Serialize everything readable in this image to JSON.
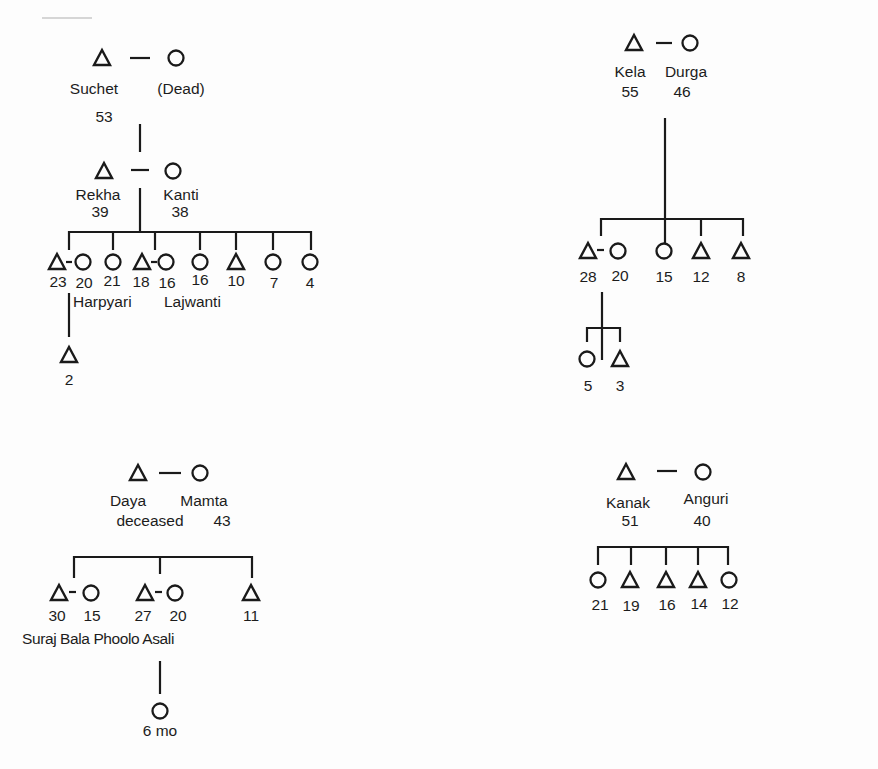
{
  "figure": {
    "type": "kinship-diagram",
    "legend": {
      "male": "triangle",
      "female": "circle",
      "marriage": "dash",
      "descent": "vertical-line"
    },
    "stroke_color": "#1a1a1a"
  },
  "families": [
    {
      "id": "suchet",
      "parents": [
        {
          "sex": "male",
          "name": "Suchet",
          "age": "53",
          "x": 102,
          "y": 58
        },
        {
          "sex": "female",
          "name": "(Dead)",
          "age": "",
          "x": 176,
          "y": 58
        }
      ],
      "texts": [
        {
          "text": "Suchet",
          "x": 94,
          "y": 80
        },
        {
          "text": "(Dead)",
          "x": 181,
          "y": 80
        },
        {
          "text": "53",
          "x": 104,
          "y": 108
        }
      ],
      "descent": [
        [
          140,
          124,
          140,
          152
        ]
      ],
      "lines": [
        [
          130,
          58,
          150,
          58
        ]
      ],
      "children_couple": {
        "parents": [
          {
            "sex": "male",
            "name": "Rekha",
            "age": "39",
            "x": 104,
            "y": 171
          },
          {
            "sex": "female",
            "name": "Kanti",
            "age": "38",
            "x": 173,
            "y": 171
          }
        ],
        "texts": [
          {
            "text": "Rekha",
            "x": 98,
            "y": 186
          },
          {
            "text": "39",
            "x": 100,
            "y": 203
          },
          {
            "text": "Kanti",
            "x": 181,
            "y": 186
          },
          {
            "text": "38",
            "x": 180,
            "y": 203
          }
        ]
      },
      "children": [
        {
          "sex": "male",
          "age": "23",
          "x": 57,
          "y": 262,
          "spouse": {
            "sex": "female",
            "age": "20",
            "name": "Harpyari",
            "x": 83,
            "y": 262
          }
        },
        {
          "sex": "female",
          "age": "21",
          "x": 113,
          "y": 262
        },
        {
          "sex": "male",
          "age": "18",
          "x": 142,
          "y": 262,
          "spouse": {
            "sex": "female",
            "age": "16",
            "name": "Lajwanti",
            "x": 166,
            "y": 262
          }
        },
        {
          "sex": "female",
          "age": "16",
          "x": 200,
          "y": 262
        },
        {
          "sex": "male",
          "age": "10",
          "x": 236,
          "y": 262
        },
        {
          "sex": "female",
          "age": "7",
          "x": 273,
          "y": 262
        },
        {
          "sex": "female",
          "age": "4",
          "x": 310,
          "y": 262
        }
      ],
      "grandchildren": [
        {
          "sex": "male",
          "age": "2",
          "x": 69,
          "y": 355
        }
      ]
    },
    {
      "id": "kela",
      "parents": [
        {
          "sex": "male",
          "name": "Kela",
          "age": "55",
          "x": 634,
          "y": 43
        },
        {
          "sex": "female",
          "name": "Durga",
          "age": "46",
          "x": 690,
          "y": 43
        }
      ],
      "children": [
        {
          "sex": "male",
          "age": "28",
          "x": 588,
          "y": 251,
          "spouse": {
            "sex": "female",
            "age": "20",
            "x": 618,
            "y": 251
          }
        },
        {
          "sex": "female",
          "age": "15",
          "x": 664,
          "y": 251
        },
        {
          "sex": "male",
          "age": "12",
          "x": 701,
          "y": 251
        },
        {
          "sex": "male",
          "age": "8",
          "x": 741,
          "y": 251
        }
      ],
      "grandchildren": [
        {
          "sex": "female",
          "age": "5",
          "x": 587,
          "y": 359
        },
        {
          "sex": "male",
          "age": "3",
          "x": 620,
          "y": 359
        }
      ]
    },
    {
      "id": "daya",
      "parents": [
        {
          "sex": "male",
          "name": "Daya",
          "age": "deceased",
          "x": 138,
          "y": 473
        },
        {
          "sex": "female",
          "name": "Mamta",
          "age": "43",
          "x": 200,
          "y": 473
        }
      ],
      "children": [
        {
          "sex": "male",
          "age": "30",
          "name": "Suraj",
          "x": 59,
          "y": 593,
          "spouse": {
            "sex": "female",
            "age": "15",
            "name": "Bala",
            "x": 91,
            "y": 593
          }
        },
        {
          "sex": "male",
          "age": "27",
          "name": "Phoolo",
          "x": 145,
          "y": 593,
          "spouse": {
            "sex": "female",
            "age": "20",
            "name": "Asali",
            "x": 175,
            "y": 593
          }
        },
        {
          "sex": "male",
          "age": "11",
          "x": 251,
          "y": 593
        }
      ],
      "grandchildren": [
        {
          "sex": "female",
          "age": "6 mo",
          "x": 160,
          "y": 711
        }
      ]
    },
    {
      "id": "kanak",
      "parents": [
        {
          "sex": "male",
          "name": "Kanak",
          "age": "51",
          "x": 626,
          "y": 472
        },
        {
          "sex": "female",
          "name": "Anguri",
          "age": "40",
          "x": 703,
          "y": 472
        }
      ],
      "children": [
        {
          "sex": "female",
          "age": "21",
          "x": 598,
          "y": 580
        },
        {
          "sex": "male",
          "age": "19",
          "x": 630,
          "y": 580
        },
        {
          "sex": "male",
          "age": "16",
          "x": 666,
          "y": 580
        },
        {
          "sex": "male",
          "age": "14",
          "x": 698,
          "y": 580
        },
        {
          "sex": "female",
          "age": "12",
          "x": 729,
          "y": 580
        }
      ]
    }
  ],
  "labels": {
    "suchet": "Suchet",
    "suchet_wife": "(Dead)",
    "suchet_age": "53",
    "rekha": "Rekha",
    "rekha_age": "39",
    "kanti": "Kanti",
    "kanti_age": "38",
    "c1_23": "23",
    "c1_20": "20",
    "c1_21": "21",
    "c1_18": "18",
    "c1_16a": "16",
    "c1_16b": "16",
    "c1_10": "10",
    "c1_7": "7",
    "c1_4": "4",
    "harpyari": "Harpyari",
    "lajwanti": "Lajwanti",
    "gc1_2": "2",
    "kela": "Kela",
    "durga": "Durga",
    "kela_age": "55",
    "durga_age": "46",
    "c2_28": "28",
    "c2_20": "20",
    "c2_15": "15",
    "c2_12": "12",
    "c2_8": "8",
    "gc2_5": "5",
    "gc2_3": "3",
    "daya": "Daya",
    "mamta": "Mamta",
    "daya_status": "deceased",
    "mamta_age": "43",
    "c3_30": "30",
    "c3_15": "15",
    "c3_27": "27",
    "c3_20": "20",
    "c3_11": "11",
    "c3_names": "Suraj Bala Phoolo Asali",
    "gc3_6mo": "6 mo",
    "kanak": "Kanak",
    "anguri": "Anguri",
    "kanak_age": "51",
    "anguri_age": "40",
    "c4_21": "21",
    "c4_19": "19",
    "c4_16": "16",
    "c4_14": "14",
    "c4_12": "12"
  }
}
